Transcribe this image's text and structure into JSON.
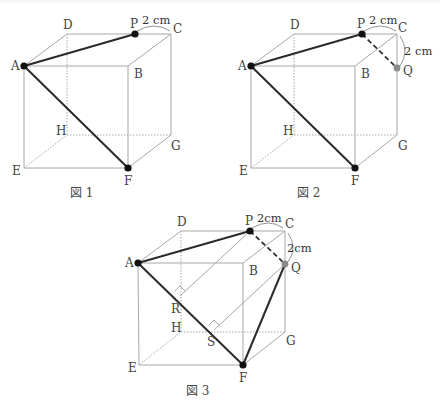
{
  "figures": [
    {
      "caption": "図 1",
      "labels": {
        "A": "A",
        "B": "B",
        "C": "C",
        "D": "D",
        "E": "E",
        "F": "F",
        "G": "G",
        "H": "H",
        "P": "P"
      },
      "dimension_PC": "2 cm"
    },
    {
      "caption": "図 2",
      "labels": {
        "A": "A",
        "B": "B",
        "C": "C",
        "D": "D",
        "E": "E",
        "F": "F",
        "G": "G",
        "H": "H",
        "P": "P",
        "Q": "Q"
      },
      "dimension_PC": "2 cm",
      "dimension_CQ": "2 cm"
    },
    {
      "caption": "図 3",
      "labels": {
        "A": "A",
        "B": "B",
        "C": "C",
        "D": "D",
        "E": "E",
        "F": "F",
        "G": "G",
        "H": "H",
        "P": "P",
        "Q": "Q",
        "R": "R",
        "S": "S"
      },
      "dimension_PC": "2cm",
      "dimension_CQ": "2cm"
    }
  ],
  "colors": {
    "edge": "#a8a8a8",
    "highlight": "#2a2a2a",
    "point_black": "#111111",
    "point_gray": "#8a8a8a"
  }
}
